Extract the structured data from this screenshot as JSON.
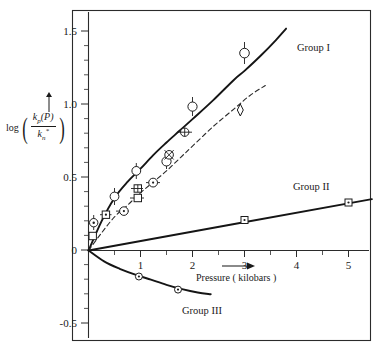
{
  "figure": {
    "y_axis": {
      "label_prefix": "log",
      "numerator": "k_p(P)",
      "numerator_base": "k",
      "numerator_sub": "p",
      "numerator_arg": "(P)",
      "denominator_base": "k",
      "denominator_sub": "n",
      "denominator_sup": "*",
      "ticks": [
        "1.5",
        "1.0",
        "0.5",
        "0",
        "-0.5"
      ],
      "tick_values": [
        1.5,
        1.0,
        0.5,
        0,
        -0.5
      ]
    },
    "x_axis": {
      "title": "Pressure ( kilobars )",
      "ticks": [
        "1",
        "2",
        "3",
        "4",
        "5"
      ],
      "tick_values": [
        1,
        2,
        3,
        4,
        5
      ]
    },
    "annotations": {
      "group_i": "Group I",
      "group_ii": "Group II",
      "group_iii": "Group III"
    }
  },
  "chart_data": {
    "type": "scatter",
    "title": "",
    "xlabel": "Pressure ( kilobars )",
    "ylabel": "log ( k_p(P) / k_n* )",
    "xlim": [
      0,
      5.6
    ],
    "ylim": [
      -0.55,
      1.62
    ],
    "grid": false,
    "legend": "inline-annotations",
    "xticks": [
      1,
      2,
      3,
      4,
      5
    ],
    "yticks": [
      -0.5,
      0,
      0.5,
      1.0,
      1.5
    ],
    "series": [
      {
        "name": "Group I",
        "style": "solid-curve",
        "marker": "open-circle",
        "line": {
          "x": [
            0,
            0.25,
            0.5,
            0.75,
            1.0,
            1.25,
            1.5,
            1.75,
            2.0,
            2.4,
            2.8,
            3.0,
            3.3,
            3.6,
            3.8
          ],
          "y": [
            0,
            0.2,
            0.36,
            0.47,
            0.56,
            0.655,
            0.74,
            0.82,
            0.9,
            1.03,
            1.17,
            1.23,
            1.33,
            1.44,
            1.52
          ]
        },
        "points": [
          {
            "x": 0.1,
            "y": 0.19,
            "marker": "circle-dot",
            "yerr": 0.05
          },
          {
            "x": 0.5,
            "y": 0.37,
            "marker": "circle-open",
            "yerr": 0.055
          },
          {
            "x": 0.92,
            "y": 0.545,
            "marker": "circle-open",
            "yerr": 0.05
          },
          {
            "x": 1.5,
            "y": 0.61,
            "marker": "circle-open",
            "yerr": 0.05
          },
          {
            "x": 2.0,
            "y": 0.985,
            "marker": "circle-open",
            "yerr": 0.06
          },
          {
            "x": 3.0,
            "y": 1.345,
            "marker": "circle-open",
            "yerr": 0.075
          }
        ]
      },
      {
        "name": "Group I (dashed companion)",
        "style": "dashed-curve",
        "marker": "open-square",
        "line": {
          "x": [
            0,
            0.25,
            0.5,
            0.75,
            1.0,
            1.25,
            1.5,
            1.75,
            2.0,
            2.4,
            2.8,
            3.1,
            3.4
          ],
          "y": [
            0,
            0.12,
            0.23,
            0.31,
            0.395,
            0.47,
            0.545,
            0.63,
            0.715,
            0.85,
            0.97,
            1.06,
            1.13
          ]
        },
        "points": [
          {
            "x": 0.08,
            "y": 0.095,
            "marker": "square-open"
          },
          {
            "x": 0.35,
            "y": 0.245,
            "marker": "square-dot",
            "xerr": 0.1
          },
          {
            "x": 0.68,
            "y": 0.27,
            "marker": "circle-dot",
            "xerr": 0.12
          },
          {
            "x": 0.95,
            "y": 0.36,
            "marker": "square-open",
            "xerr": 0.12
          },
          {
            "x": 0.95,
            "y": 0.425,
            "marker": "square-cross",
            "xerr": 0.1
          },
          {
            "x": 1.32,
            "y": 0.465,
            "marker": "circle-dot",
            "xerr": 0.12
          },
          {
            "x": 1.55,
            "y": 0.655,
            "marker": "circle-cross"
          },
          {
            "x": 1.85,
            "y": 0.81,
            "marker": "circle-cross",
            "xerr": 0.13
          },
          {
            "x": 2.92,
            "y": 1.0,
            "marker": "diamond-open"
          }
        ]
      },
      {
        "name": "Group II",
        "style": "solid-line",
        "marker": "square-dot",
        "line": {
          "x": [
            0,
            5.45
          ],
          "y": [
            0,
            0.352
          ]
        },
        "points": [
          {
            "x": 3.0,
            "y": 0.208,
            "marker": "square-dot"
          },
          {
            "x": 5.0,
            "y": 0.325,
            "marker": "square-dot"
          }
        ]
      },
      {
        "name": "Group III",
        "style": "solid-curve",
        "marker": "circle-dot",
        "line": {
          "x": [
            0,
            0.3,
            0.6,
            0.9,
            1.2,
            1.5,
            1.8,
            2.1,
            2.35
          ],
          "y": [
            0,
            -0.075,
            -0.125,
            -0.165,
            -0.2,
            -0.235,
            -0.265,
            -0.288,
            -0.3
          ]
        },
        "points": [
          {
            "x": 0.95,
            "y": -0.178,
            "marker": "circle-dot"
          },
          {
            "x": 1.72,
            "y": -0.268,
            "marker": "circle-dot"
          }
        ]
      }
    ],
    "annotations": [
      {
        "text": "Group I",
        "x": 3.95,
        "y": 1.345
      },
      {
        "text": "Group II",
        "x": 4.0,
        "y": 0.5
      },
      {
        "text": "Group III",
        "x": 1.75,
        "y": -0.4
      }
    ]
  }
}
